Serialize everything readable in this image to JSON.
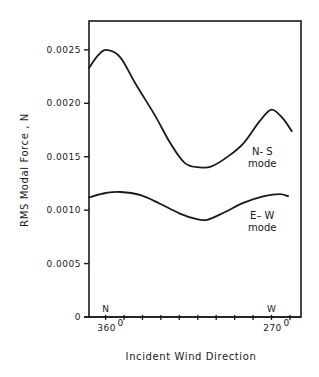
{
  "chart_data": {
    "type": "line",
    "title": "",
    "xlabel": "Incident Wind Direction",
    "ylabel": "RMS Modal Force , N",
    "x_units": "degrees",
    "x_reversed": true,
    "xlim": [
      369,
      254
    ],
    "ylim": [
      0,
      0.00277
    ],
    "grid": false,
    "legend": "none (inline annotations)",
    "y_ticks": [
      {
        "value": 0,
        "label": "0"
      },
      {
        "value": 0.0005,
        "label": "0.0005"
      },
      {
        "value": 0.001,
        "label": "0.0010"
      },
      {
        "value": 0.0015,
        "label": "0.0015"
      },
      {
        "value": 0.002,
        "label": "0.0020"
      },
      {
        "value": 0.0025,
        "label": "0.0025"
      }
    ],
    "x_ticks": [
      360,
      350,
      340,
      330,
      320,
      310,
      300,
      290,
      280,
      270,
      260
    ],
    "x_tick_labels": [
      {
        "value": 360,
        "label": "360",
        "superscript": "0",
        "direction": "N"
      },
      {
        "value": 270,
        "label": "270",
        "superscript": "0",
        "direction": "W"
      }
    ],
    "series": [
      {
        "name": "N-S mode",
        "label_line1": "N- S",
        "label_line2": "mode",
        "label_at": {
          "x": 275,
          "y": 0.00152
        },
        "x": [
          369,
          364,
          359.5,
          352,
          344,
          333,
          325,
          317,
          309,
          302.5,
          293,
          285,
          276.5,
          270,
          264,
          259
        ],
        "values": [
          0.00233,
          0.00245,
          0.0025,
          0.00243,
          0.00219,
          0.00188,
          0.00163,
          0.00144,
          0.0014,
          0.00141,
          0.00151,
          0.00163,
          0.00183,
          0.00194,
          0.00186,
          0.00174
        ]
      },
      {
        "name": "E-W mode",
        "label_line1": "E– W",
        "label_line2": "mode",
        "label_at": {
          "x": 275,
          "y": 0.00092
        },
        "x": [
          369,
          360,
          352,
          341,
          330.5,
          320,
          311.5,
          305,
          295.5,
          285,
          274,
          265.5,
          261
        ],
        "values": [
          0.00112,
          0.00116,
          0.00117,
          0.00114,
          0.00106,
          0.00097,
          0.00092,
          0.00091,
          0.00098,
          0.00107,
          0.00113,
          0.00115,
          0.00113
        ]
      }
    ]
  }
}
